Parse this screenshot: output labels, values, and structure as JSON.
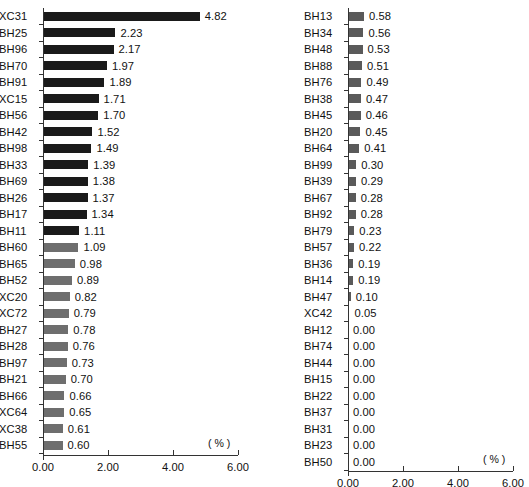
{
  "chart_data": [
    {
      "id": "left-panel",
      "type": "bar",
      "orientation": "horizontal",
      "title": "",
      "xlabel": "( % )",
      "ylabel": "",
      "xlim": [
        0.0,
        6.0
      ],
      "xticks": [
        "0.00",
        "2.00",
        "4.00",
        "6.00"
      ],
      "xtick_values": [
        0.0,
        2.0,
        4.0,
        6.0
      ],
      "grid": false,
      "legend": "none",
      "unit_label": "( % )",
      "categories": [
        "XC31",
        "BH25",
        "BH96",
        "BH70",
        "BH91",
        "XC15",
        "BH56",
        "BH42",
        "BH98",
        "BH33",
        "BH69",
        "BH26",
        "BH17",
        "BH11",
        "BH60",
        "BH65",
        "BH52",
        "XC20",
        "XC72",
        "BH27",
        "BH28",
        "BH97",
        "BH21",
        "BH66",
        "XC64",
        "XC38",
        "BH55"
      ],
      "values": [
        4.82,
        2.23,
        2.17,
        1.97,
        1.89,
        1.71,
        1.7,
        1.52,
        1.49,
        1.39,
        1.38,
        1.37,
        1.34,
        1.11,
        1.09,
        0.98,
        0.89,
        0.82,
        0.79,
        0.78,
        0.76,
        0.73,
        0.7,
        0.66,
        0.65,
        0.61,
        0.6
      ],
      "value_labels": [
        "4.82",
        "2.23",
        "2.17",
        "1.97",
        "1.89",
        "1.71",
        "1.70",
        "1.52",
        "1.49",
        "1.39",
        "1.38",
        "1.37",
        "1.34",
        "1.11",
        "1.09",
        "0.98",
        "0.89",
        "0.82",
        "0.79",
        "0.78",
        "0.76",
        "0.73",
        "0.70",
        "0.66",
        "0.65",
        "0.61",
        "0.60"
      ],
      "bar_colors": [
        "#1a1a1a",
        "#1a1a1a",
        "#1a1a1a",
        "#1a1a1a",
        "#1a1a1a",
        "#1a1a1a",
        "#1a1a1a",
        "#1a1a1a",
        "#1a1a1a",
        "#1a1a1a",
        "#1a1a1a",
        "#1a1a1a",
        "#1a1a1a",
        "#1a1a1a",
        "#6e6e6e",
        "#6e6e6e",
        "#6e6e6e",
        "#6e6e6e",
        "#6e6e6e",
        "#6e6e6e",
        "#6e6e6e",
        "#6e6e6e",
        "#6e6e6e",
        "#6e6e6e",
        "#6e6e6e",
        "#6e6e6e",
        "#6e6e6e"
      ]
    },
    {
      "id": "right-panel",
      "type": "bar",
      "orientation": "horizontal",
      "title": "",
      "xlabel": "( % )",
      "ylabel": "",
      "xlim": [
        0.0,
        6.0
      ],
      "xticks": [
        "0.00",
        "2.00",
        "4.00",
        "6.00"
      ],
      "xtick_values": [
        0.0,
        2.0,
        4.0,
        6.0
      ],
      "grid": false,
      "legend": "none",
      "unit_label": "( % )",
      "categories": [
        "BH13",
        "BH34",
        "BH48",
        "BH88",
        "BH76",
        "BH38",
        "BH45",
        "BH20",
        "BH64",
        "BH99",
        "BH39",
        "BH67",
        "BH92",
        "BH79",
        "BH57",
        "BH36",
        "BH14",
        "BH47",
        "XC42",
        "BH12",
        "BH74",
        "BH44",
        "BH15",
        "BH22",
        "BH37",
        "BH31",
        "BH23",
        "BH50"
      ],
      "values": [
        0.58,
        0.56,
        0.53,
        0.51,
        0.49,
        0.47,
        0.46,
        0.45,
        0.41,
        0.3,
        0.29,
        0.28,
        0.28,
        0.23,
        0.22,
        0.19,
        0.19,
        0.1,
        0.05,
        0.0,
        0.0,
        0.0,
        0.0,
        0.0,
        0.0,
        0.0,
        0.0,
        0.0
      ],
      "value_labels": [
        "0.58",
        "0.56",
        "0.53",
        "0.51",
        "0.49",
        "0.47",
        "0.46",
        "0.45",
        "0.41",
        "0.30",
        "0.29",
        "0.28",
        "0.28",
        "0.23",
        "0.22",
        "0.19",
        "0.19",
        "0.10",
        "0.05",
        "0.00",
        "0.00",
        "0.00",
        "0.00",
        "0.00",
        "0.00",
        "0.00",
        "0.00",
        "0.00"
      ],
      "bar_colors": [
        "#5a5a5a",
        "#5a5a5a",
        "#5a5a5a",
        "#5a5a5a",
        "#5a5a5a",
        "#5a5a5a",
        "#5a5a5a",
        "#5a5a5a",
        "#5a5a5a",
        "#5a5a5a",
        "#5a5a5a",
        "#5a5a5a",
        "#5a5a5a",
        "#5a5a5a",
        "#5a5a5a",
        "#5a5a5a",
        "#5a5a5a",
        "#5a5a5a",
        "#5a5a5a",
        "#5a5a5a",
        "#5a5a5a",
        "#5a5a5a",
        "#5a5a5a",
        "#5a5a5a",
        "#5a5a5a",
        "#5a5a5a",
        "#5a5a5a",
        "#5a5a5a"
      ]
    }
  ]
}
